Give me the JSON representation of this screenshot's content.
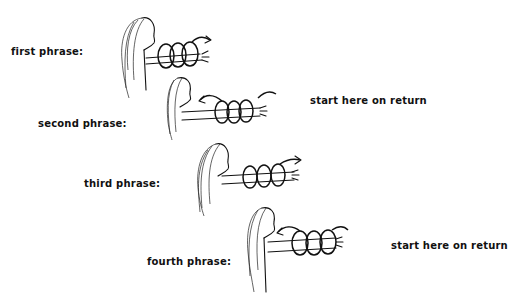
{
  "figure": {
    "phrases": [
      {
        "label": "first phrase:",
        "note": "",
        "arrow_direction": "right"
      },
      {
        "label": "second phrase:",
        "note": "start here on return",
        "arrow_direction": "left"
      },
      {
        "label": "third phrase:",
        "note": "",
        "arrow_direction": "right"
      },
      {
        "label": "fourth phrase:",
        "note": "start here on return",
        "arrow_direction": "left"
      }
    ]
  }
}
